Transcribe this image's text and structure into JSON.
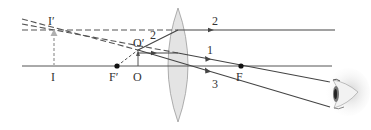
{
  "diagram": {
    "type": "converging-lens-magnifier-ray-diagram",
    "colors": {
      "line": "#444444",
      "dashed": "#555555",
      "lens_fill": "#e4e4e4",
      "lens_stroke": "#9a9a9a",
      "image_arrow": "#b0b0b0",
      "object_arrow": "#555555"
    },
    "labels": {
      "image_top": "I′",
      "image_base": "I",
      "focal_left": "F′",
      "object_base": "O",
      "object_top": "O′",
      "focal_right": "F",
      "ray1": "1",
      "ray2_before": "2",
      "ray2_after": "2",
      "ray3": "3"
    },
    "icons": {
      "eye": "eye-icon"
    }
  }
}
